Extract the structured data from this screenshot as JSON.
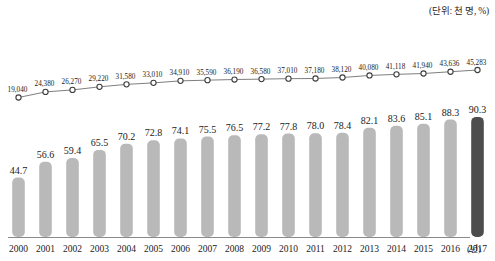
{
  "unit_note": "(단위: 천 명, %)",
  "x_axis_unit": "(년)",
  "chart_data": {
    "type": "bar",
    "title": "",
    "subtitle": "",
    "xlabel": "(년)",
    "ylabel": "",
    "annotations": [
      "(단위: 천 명, %)"
    ],
    "grid": false,
    "legend": "none",
    "categories": [
      "2000",
      "2001",
      "2002",
      "2003",
      "2004",
      "2005",
      "2006",
      "2007",
      "2008",
      "2009",
      "2010",
      "2011",
      "2012",
      "2013",
      "2014",
      "2015",
      "2016",
      "2017"
    ],
    "series": [
      {
        "name": "비율",
        "type": "bar",
        "unit": "%",
        "values": [
          44.7,
          56.6,
          59.4,
          65.5,
          70.2,
          72.8,
          74.1,
          75.5,
          76.5,
          77.2,
          77.8,
          78.0,
          78.4,
          82.1,
          83.6,
          85.1,
          88.3,
          90.3
        ],
        "labels": [
          "44.7",
          "56.6",
          "59.4",
          "65.5",
          "70.2",
          "72.8",
          "74.1",
          "75.5",
          "76.5",
          "77.2",
          "77.8",
          "78.0",
          "78.4",
          "82.1",
          "83.6",
          "85.1",
          "88.3",
          "90.3"
        ],
        "color": "#b9b9b9",
        "highlight_index": 17,
        "highlight_color": "#4d4d4d",
        "ylim": [
          0,
          100
        ]
      },
      {
        "name": "인원",
        "type": "line",
        "unit": "천 명",
        "values": [
          19040,
          24380,
          26270,
          29220,
          31580,
          33010,
          34910,
          35590,
          36190,
          36580,
          37010,
          37180,
          38120,
          40080,
          41118,
          41940,
          43636,
          45283
        ],
        "labels": [
          "19,040",
          "24,380",
          "26,270",
          "29,220",
          "31,580",
          "33,010",
          "34,910",
          "35,590",
          "36,190",
          "36,580",
          "37,010",
          "37,180",
          "38,120",
          "40,080",
          "41,118",
          "41,940",
          "43,636",
          "45,283"
        ],
        "color": "#6f6f6f",
        "marker": "open-circle",
        "ylim": [
          0,
          50000
        ]
      }
    ]
  }
}
